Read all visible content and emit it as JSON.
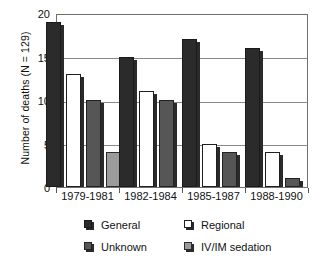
{
  "chart_data": {
    "type": "bar",
    "title": "",
    "xlabel": "",
    "ylabel": "Number of deaths (N = 129)",
    "categories": [
      "1979-1981",
      "1982-1984",
      "1985-1987",
      "1988-1990"
    ],
    "series": [
      {
        "name": "General",
        "color": "#2b2b2b",
        "values": [
          19,
          15,
          17,
          16
        ]
      },
      {
        "name": "Regional",
        "color": "#ffffff",
        "values": [
          13,
          11,
          5,
          4
        ]
      },
      {
        "name": "Unknown",
        "color": "#565656",
        "values": [
          10,
          10,
          4,
          1
        ]
      },
      {
        "name": "IV/IM sedation",
        "color": "#9b9b9b",
        "values": [
          4,
          null,
          null,
          null
        ]
      }
    ],
    "ylim": [
      0,
      20
    ],
    "yticks": [
      0,
      5,
      10,
      15,
      20
    ],
    "ytick_labels": [
      "0",
      "5",
      "10",
      "15",
      "20"
    ],
    "grid": true,
    "grid_axis": "y",
    "legend_position": "bottom",
    "legend_entries": [
      "General",
      "Regional",
      "Unknown",
      "IV/IM sedation"
    ]
  },
  "axis": {
    "y_title": "Number of deaths (N = 129)"
  }
}
